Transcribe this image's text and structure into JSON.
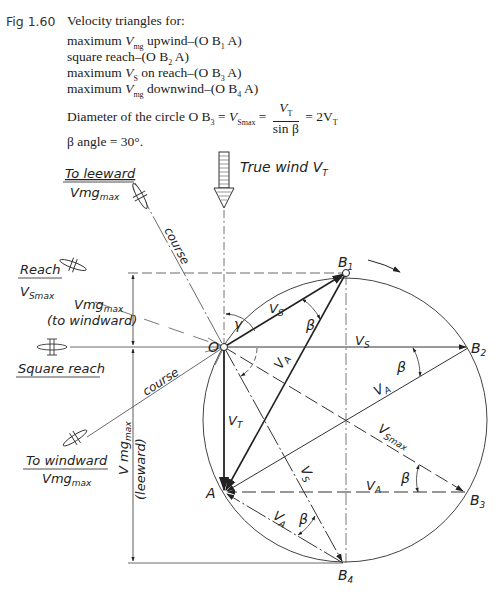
{
  "caption": {
    "figure_label": "Fig 1.60",
    "title": "Velocity triangles for:",
    "items": [
      {
        "prefix": "maximum ",
        "var": "V",
        "sub": "mg",
        "suffix": " upwind–(O B",
        "pt": "1",
        "end": " A)"
      },
      {
        "prefix": "square reach–(O B",
        "var": "",
        "sub": "",
        "suffix": "",
        "pt": "2",
        "end": " A)"
      },
      {
        "prefix": "maximum ",
        "var": "V",
        "sub": "S",
        "suffix": " on reach–(O B",
        "pt": "3",
        "end": " A)"
      },
      {
        "prefix": "maximum ",
        "var": "V",
        "sub": "mg",
        "suffix": " downwind–(O B",
        "pt": "4",
        "end": " A)"
      }
    ],
    "diameter": {
      "text": "Diameter of the circle O B",
      "sub": "3",
      "eq1": " = ",
      "vs": "V",
      "vs_sub": "Smax",
      "num": "V",
      "num_sub": "T",
      "den": "sin β",
      "result": "= 2V",
      "result_sub": "T"
    },
    "beta_line": "β angle = 30°."
  },
  "diagram": {
    "wind_label": "True wind V",
    "wind_sub": "T",
    "points": {
      "O": "O",
      "A": "A",
      "B1": "B",
      "B1_sub": "1",
      "B2": "B",
      "B2_sub": "2",
      "B3": "B",
      "B3_sub": "3",
      "B4": "B",
      "B4_sub": "4"
    },
    "left_labels": {
      "to_leeward": "To leeward",
      "to_leeward_vmg": "Vmg",
      "reach": "Reach",
      "reach_vs": "V",
      "reach_vs_sub": "Smax",
      "vmg_windward": "Vmg",
      "vmg_windward_note": "(to windward)",
      "square_reach": "Square reach",
      "to_windward": "To windward",
      "to_windward_vmg": "Vmg",
      "vmg_leeward": "V mg",
      "vmg_leeward_note": "(leeward)",
      "max_sub": "max"
    },
    "course_labels": [
      "course",
      "course"
    ],
    "vector_labels": {
      "VS": "V",
      "VS_sub": "S",
      "VA": "V",
      "VA_sub": "A",
      "VT": "V",
      "VT_sub": "T",
      "VSmax": "V",
      "VSmax_sub": "Smax"
    },
    "angles": {
      "beta": "β",
      "gamma": "γ"
    },
    "geometry": {
      "O": [
        224,
        347
      ],
      "A": [
        225,
        492
      ],
      "B1": [
        346,
        273
      ],
      "B2": [
        468,
        348
      ],
      "B3": [
        465,
        492
      ],
      "B4": [
        343,
        563
      ],
      "circle_center": [
        345,
        420
      ],
      "circle_radius": 142
    },
    "colors": {
      "ink": "#222222",
      "thin": "#444444"
    }
  }
}
